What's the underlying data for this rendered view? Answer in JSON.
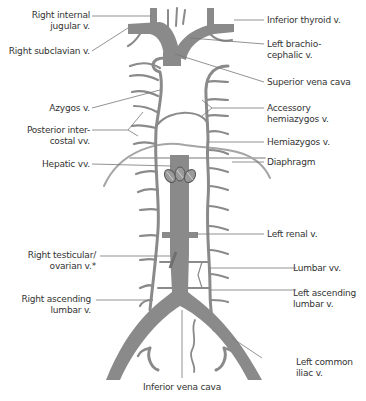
{
  "figure": {
    "colors": {
      "vessel": "#8a8a8a",
      "vessel_dark": "#6f6f6f",
      "leader": "#777777",
      "text": "#333333",
      "background": "#ffffff"
    }
  },
  "labels_left": [
    {
      "id": "right-internal-jugular",
      "lines": [
        "Right internal",
        "jugular v."
      ]
    },
    {
      "id": "right-subclavian",
      "lines": [
        "Right subclavian v."
      ]
    },
    {
      "id": "azygos",
      "lines": [
        "Azygos v."
      ]
    },
    {
      "id": "posterior-intercostal",
      "lines": [
        "Posterior inter-",
        "costal vv."
      ]
    },
    {
      "id": "hepatic",
      "lines": [
        "Hepatic vv."
      ]
    },
    {
      "id": "right-testicular-ovarian",
      "lines": [
        "Right testicular/",
        "ovarian v.*"
      ]
    },
    {
      "id": "right-ascending-lumbar",
      "lines": [
        "Right ascending",
        "lumbar v."
      ]
    }
  ],
  "labels_right": [
    {
      "id": "inferior-thyroid",
      "lines": [
        "Inferior thyroid v."
      ]
    },
    {
      "id": "left-brachiocephalic",
      "lines": [
        "Left brachio-",
        "cephalic v."
      ]
    },
    {
      "id": "superior-vena-cava",
      "lines": [
        "Superior vena cava"
      ]
    },
    {
      "id": "accessory-hemiazygos",
      "lines": [
        "Accessory",
        "hemiazygos v."
      ]
    },
    {
      "id": "hemiazygos",
      "lines": [
        "Hemiazygos v."
      ]
    },
    {
      "id": "diaphragm",
      "lines": [
        "Diaphragm"
      ]
    },
    {
      "id": "left-renal",
      "lines": [
        "Left renal v."
      ]
    },
    {
      "id": "lumbar",
      "lines": [
        "Lumbar vv."
      ]
    },
    {
      "id": "left-ascending-lumbar",
      "lines": [
        "Left ascending",
        "lumbar v."
      ]
    },
    {
      "id": "left-common-iliac",
      "lines": [
        "Left common",
        "iliac v."
      ]
    }
  ],
  "labels_bottom": [
    {
      "id": "inferior-vena-cava",
      "lines": [
        "Inferior vena cava"
      ]
    }
  ]
}
